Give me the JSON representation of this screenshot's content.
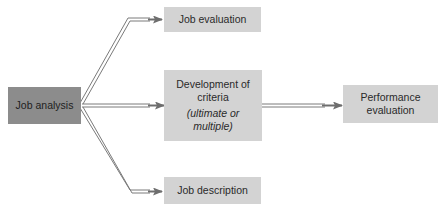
{
  "diagram": {
    "nodes": {
      "job_analysis": {
        "label": "Job analysis"
      },
      "job_evaluation": {
        "label": "Job evaluation"
      },
      "development_of_criteria": {
        "line1": "Development of",
        "line2": "criteria",
        "line3": "(ultimate or",
        "line4": "multiple)"
      },
      "job_description": {
        "label": "Job description"
      },
      "performance_evaluation": {
        "line1": "Performance",
        "line2": "evaluation"
      }
    },
    "edges": [
      {
        "from": "Job analysis",
        "to": "Job evaluation"
      },
      {
        "from": "Job analysis",
        "to": "Development of criteria (ultimate or multiple)"
      },
      {
        "from": "Job analysis",
        "to": "Job description"
      },
      {
        "from": "Development of criteria (ultimate or multiple)",
        "to": "Performance evaluation"
      }
    ],
    "colors": {
      "source_box": "#8c8c8c",
      "target_box": "#d3d3d3",
      "arrow": "#6e6e6e"
    }
  }
}
